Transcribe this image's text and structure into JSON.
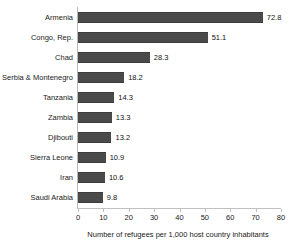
{
  "chart_data": {
    "type": "bar",
    "orientation": "horizontal",
    "title": "",
    "xlabel": "Number of refugees per 1,000 host country inhabitants",
    "ylabel": "",
    "xlim": [
      0,
      80
    ],
    "xticks": [
      0,
      10,
      20,
      30,
      40,
      50,
      60,
      70,
      80
    ],
    "grid": false,
    "legend": false,
    "bar_color": "#4a4a4a",
    "categories": [
      "Armenia",
      "Congo, Rep.",
      "Chad",
      "Serbia & Montenegro",
      "Tanzania",
      "Zambia",
      "Djibouti",
      "Sierra Leone",
      "Iran",
      "Saudi Arabia"
    ],
    "values": [
      72.8,
      51.1,
      28.3,
      18.2,
      14.3,
      13.3,
      13.2,
      10.9,
      10.6,
      9.8
    ],
    "value_labels": [
      "72.8",
      "51.1",
      "28.3",
      "18.2",
      "14.3",
      "13.3",
      "13.2",
      "10.9",
      "10.6",
      "9.8"
    ],
    "tick_labels": [
      "0",
      "10",
      "20",
      "30",
      "40",
      "50",
      "60",
      "70",
      "80"
    ]
  }
}
